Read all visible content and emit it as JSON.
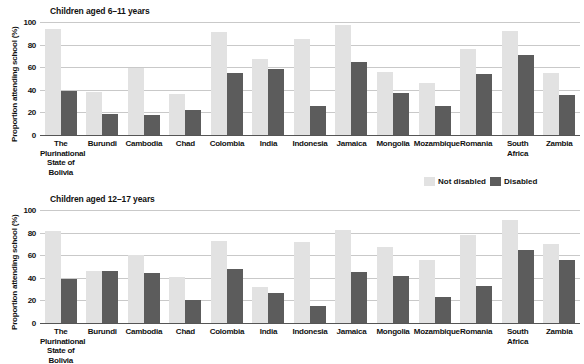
{
  "figure": {
    "axis_label": "Proportion attending school (%)",
    "legend": {
      "not_disabled": "Not disabled",
      "disabled": "Disabled"
    },
    "colors": {
      "not_disabled": "#e2e2e2",
      "disabled": "#5c5c5c",
      "gridline": "#c9c9c9",
      "text": "#111111"
    }
  },
  "chart_data": [
    {
      "type": "bar",
      "title": "Children aged 6–11 years",
      "xlabel": "",
      "ylabel": "Proportion attending school (%)",
      "ylim": [
        0,
        100
      ],
      "yticks": [
        0,
        20,
        40,
        60,
        80,
        100
      ],
      "grid": true,
      "legend_position": "bottom-right",
      "categories": [
        "The Plurinational State of Bolivia",
        "Burundi",
        "Cambodia",
        "Chad",
        "Colombia",
        "India",
        "Indonesia",
        "Jamaica",
        "Mongolia",
        "Mozambique",
        "Romania",
        "South Africa",
        "Zambia"
      ],
      "category_lines": [
        [
          "The",
          "Plurinational",
          "State of Bolivia"
        ],
        [
          "Burundi"
        ],
        [
          "Cambodia"
        ],
        [
          "Chad"
        ],
        [
          "Colombia"
        ],
        [
          "India"
        ],
        [
          "Indonesia"
        ],
        [
          "Jamaica"
        ],
        [
          "Mongolia"
        ],
        [
          "Mozambique"
        ],
        [
          "Romania"
        ],
        [
          "South Africa"
        ],
        [
          "Zambia"
        ]
      ],
      "series": [
        {
          "name": "Not disabled",
          "color": "#e2e2e2",
          "values": [
            94,
            38,
            59,
            36,
            91,
            67,
            85,
            97,
            56,
            46,
            76,
            92,
            55
          ]
        },
        {
          "name": "Disabled",
          "color": "#5c5c5c",
          "values": [
            39,
            19,
            18,
            22,
            55,
            58,
            26,
            65,
            37,
            26,
            54,
            71,
            35
          ]
        }
      ]
    },
    {
      "type": "bar",
      "title": "Children aged 12–17 years",
      "xlabel": "",
      "ylabel": "Proportion attending school (%)",
      "ylim": [
        0,
        100
      ],
      "yticks": [
        0,
        20,
        40,
        60,
        80,
        100
      ],
      "grid": true,
      "legend_position": "none",
      "categories": [
        "The Plurinational State of Bolivia",
        "Burundi",
        "Cambodia",
        "Chad",
        "Colombia",
        "India",
        "Indonesia",
        "Jamaica",
        "Mongolia",
        "Mozambique",
        "Romania",
        "South Africa",
        "Zambia"
      ],
      "category_lines": [
        [
          "The",
          "Plurinational",
          "State of Bolivia"
        ],
        [
          "Burundi"
        ],
        [
          "Cambodia"
        ],
        [
          "Chad"
        ],
        [
          "Colombia"
        ],
        [
          "India"
        ],
        [
          "Indonesia"
        ],
        [
          "Jamaica"
        ],
        [
          "Mongolia"
        ],
        [
          "Mozambique"
        ],
        [
          "Romania"
        ],
        [
          "South Africa"
        ],
        [
          "Zambia"
        ]
      ],
      "series": [
        {
          "name": "Not disabled",
          "color": "#e2e2e2",
          "values": [
            81,
            46,
            60,
            41,
            73,
            32,
            72,
            82,
            67,
            56,
            78,
            91,
            70
          ]
        },
        {
          "name": "Disabled",
          "color": "#5c5c5c",
          "values": [
            39,
            46,
            44,
            20,
            48,
            27,
            15,
            45,
            42,
            23,
            33,
            65,
            56
          ]
        }
      ]
    }
  ]
}
